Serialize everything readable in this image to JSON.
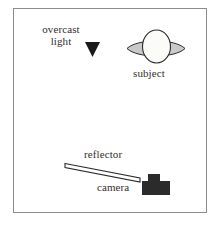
{
  "diagram": {
    "frame": {
      "stroke_color": "#8c8c8c",
      "fill_color": "#ffffff"
    },
    "labels": {
      "light_line1": "overcast",
      "light_line2": "light",
      "subject": "subject",
      "reflector": "reflector",
      "camera": "camera"
    },
    "colors": {
      "text": "#332f2e",
      "outline": "#2b2b2b",
      "shoulder_fill": "#c9c9c9",
      "head_fill": "#fbfbf8",
      "camera_fill": "#2b2b2b",
      "reflector_fill": "#ffffff",
      "arrow_fill": "#1a1a1a"
    },
    "elements": [
      {
        "name": "light-direction-arrow",
        "shape": "filled-triangle-down",
        "description": "downward pointing arrowhead indicating overcast light from above"
      },
      {
        "name": "subject-shoulders",
        "shape": "pointed-ellipse-horizontal",
        "description": "gray horizontal lens shape representing shoulders"
      },
      {
        "name": "subject-head",
        "shape": "ellipse-vertical",
        "description": "white vertical ellipse representing the head"
      },
      {
        "name": "reflector-panel",
        "shape": "thin-tilted-parallelogram",
        "description": "thin white panel tilted down to the right below the subject"
      },
      {
        "name": "camera-body",
        "shape": "t-block",
        "description": "solid dark camera icon with viewfinder block on top"
      }
    ]
  }
}
